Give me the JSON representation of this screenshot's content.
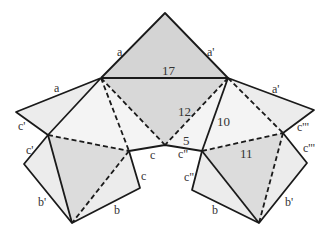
{
  "diagram": {
    "title": "",
    "colors": {
      "dark_fill": "#d4d4d4",
      "light_fill": "#ececec",
      "stroke": "#1a1a1a",
      "text": "#333333"
    },
    "numbers": {
      "n17": "17",
      "n12": "12",
      "n10": "10",
      "n5": "5",
      "n11": "11"
    },
    "edge_labels": {
      "top_a": "a",
      "top_a_prime": "a'",
      "left_a": "a",
      "right_a_prime": "a'",
      "left_c_prime_upper": "c'",
      "left_c_prime_lower": "c'",
      "right_c_triple_upper": "c'''",
      "right_c_triple_lower": "c'''",
      "center_c": "c",
      "center_c_double": "c\"",
      "left_c": "c",
      "right_c_double": "c\"",
      "left_b_prime": "b'",
      "left_b": "b",
      "right_b": "b",
      "right_b_prime": "b'"
    }
  }
}
